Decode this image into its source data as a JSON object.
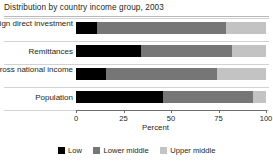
{
  "title": "Distribution by country income group, 2003",
  "chart_data": {
    "type": "bar",
    "orientation": "horizontal",
    "stacked": true,
    "normalized": true,
    "title": "Distribution by country income group, 2003",
    "xlabel": "Percent",
    "ylabel": "",
    "xlim": [
      0,
      100
    ],
    "xticks": [
      0,
      25,
      50,
      75,
      100
    ],
    "xtick_labels": [
      "0",
      "25",
      "50",
      "75",
      "100"
    ],
    "grid": false,
    "legend_position": "bottom",
    "categories": [
      "Foreign direct investment",
      "Remittances",
      "Gross national income",
      "Population"
    ],
    "series": [
      {
        "name": "Low",
        "color": "#000000",
        "values": [
          11,
          34,
          16,
          46
        ]
      },
      {
        "name": "Lower middle",
        "color": "#767676",
        "values": [
          68,
          48,
          58,
          47
        ]
      },
      {
        "name": "Upper middle",
        "color": "#c3c3c3",
        "values": [
          21,
          18,
          26,
          7
        ]
      }
    ]
  },
  "axis": {
    "title": "Percent",
    "ticks": [
      {
        "value": 0,
        "label": "0"
      },
      {
        "value": 25,
        "label": "25"
      },
      {
        "value": 50,
        "label": "50"
      },
      {
        "value": 75,
        "label": "75"
      },
      {
        "value": 100,
        "label": "100"
      }
    ]
  },
  "legend": {
    "items": [
      {
        "label": "Low",
        "color": "#000000"
      },
      {
        "label": "Lower middle",
        "color": "#767676"
      },
      {
        "label": "Upper middle",
        "color": "#c3c3c3"
      }
    ]
  }
}
